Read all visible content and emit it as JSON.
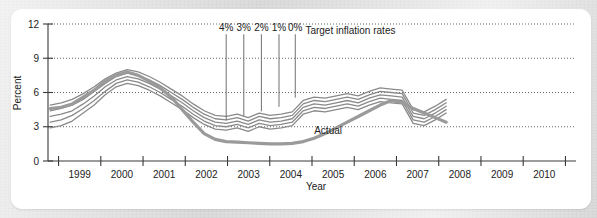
{
  "chart_data": {
    "type": "line",
    "title": "",
    "xlabel": "Year",
    "ylabel": "Percent",
    "xlim": [
      1998.5,
      2010.5
    ],
    "ylim": [
      0,
      12
    ],
    "yticks": [
      0,
      3,
      6,
      9,
      12
    ],
    "xticks": [
      "1999",
      "2000",
      "2001",
      "2002",
      "2003",
      "2004",
      "2005",
      "2006",
      "2007",
      "2008",
      "2009",
      "2010"
    ],
    "grid": "horizontal-dotted",
    "legend_position": "inline-annotations",
    "annotations": [
      {
        "name": "target-legend",
        "text": "Target inflation rates",
        "x": 2004.35,
        "y": 11.1
      },
      {
        "name": "actual-label",
        "text": "Actual",
        "x": 2004.55,
        "y": 2.35
      }
    ],
    "target_markers": [
      {
        "label": "4%",
        "x": 2002.55,
        "y_top": 11.1,
        "y_bottom": 3.55
      },
      {
        "label": "3%",
        "x": 2002.95,
        "y_top": 11.1,
        "y_bottom": 3.95
      },
      {
        "label": "2%",
        "x": 2003.35,
        "y_top": 11.1,
        "y_bottom": 4.35
      },
      {
        "label": "1%",
        "x": 2003.75,
        "y_top": 11.1,
        "y_bottom": 4.75
      },
      {
        "label": "0%",
        "x": 2004.12,
        "y_top": 11.1,
        "y_bottom": 5.55
      }
    ],
    "x": [
      1998.55,
      1998.8,
      1999.05,
      1999.3,
      1999.55,
      1999.8,
      2000.05,
      2000.3,
      2000.55,
      2000.8,
      2001.05,
      2001.3,
      2001.55,
      2001.8,
      2002.05,
      2002.3,
      2002.55,
      2002.8,
      2003.05,
      2003.3,
      2003.55,
      2003.8,
      2004.05,
      2004.3,
      2004.55,
      2004.8,
      2005.05,
      2005.3,
      2005.55,
      2005.8,
      2006.05,
      2006.3,
      2006.55,
      2006.8,
      2007.05,
      2007.3,
      2007.55
    ],
    "series": [
      {
        "name": "Target 4%",
        "color": "#8a8a8a",
        "values": [
          4.9,
          5.1,
          5.4,
          5.9,
          6.5,
          7.2,
          7.7,
          8.0,
          7.8,
          7.4,
          6.9,
          6.3,
          5.7,
          5.0,
          4.4,
          4.0,
          3.9,
          4.1,
          3.8,
          4.2,
          4.0,
          4.1,
          4.3,
          5.3,
          5.6,
          5.5,
          5.7,
          5.9,
          5.7,
          6.1,
          6.4,
          6.3,
          6.2,
          4.5,
          4.3,
          4.8,
          5.4
        ]
      },
      {
        "name": "Target 3%",
        "color": "#8a8a8a",
        "values": [
          4.4,
          4.6,
          4.9,
          5.4,
          6.1,
          6.8,
          7.4,
          7.7,
          7.5,
          7.1,
          6.6,
          6.0,
          5.4,
          4.7,
          4.1,
          3.7,
          3.6,
          3.8,
          3.5,
          3.9,
          3.7,
          3.8,
          4.0,
          5.0,
          5.3,
          5.2,
          5.4,
          5.6,
          5.4,
          5.8,
          6.1,
          6.0,
          5.9,
          4.2,
          4.0,
          4.5,
          5.1
        ]
      },
      {
        "name": "Target 2%",
        "color": "#8a8a8a",
        "values": [
          3.9,
          4.1,
          4.4,
          5.0,
          5.7,
          6.5,
          7.1,
          7.4,
          7.2,
          6.8,
          6.3,
          5.7,
          5.1,
          4.4,
          3.8,
          3.4,
          3.3,
          3.5,
          3.2,
          3.6,
          3.4,
          3.5,
          3.7,
          4.7,
          5.0,
          4.9,
          5.1,
          5.3,
          5.1,
          5.5,
          5.8,
          5.7,
          5.6,
          3.9,
          3.7,
          4.2,
          4.8
        ]
      },
      {
        "name": "Target 1%",
        "color": "#8a8a8a",
        "values": [
          3.4,
          3.6,
          4.0,
          4.6,
          5.3,
          6.1,
          6.8,
          7.1,
          6.9,
          6.5,
          6.0,
          5.4,
          4.8,
          4.1,
          3.5,
          3.1,
          3.0,
          3.2,
          2.9,
          3.3,
          3.1,
          3.2,
          3.4,
          4.4,
          4.7,
          4.6,
          4.8,
          5.0,
          4.8,
          5.2,
          5.5,
          5.4,
          5.3,
          3.6,
          3.4,
          3.9,
          4.5
        ]
      },
      {
        "name": "Target 0%",
        "color": "#8a8a8a",
        "values": [
          2.9,
          3.1,
          3.5,
          4.2,
          4.9,
          5.8,
          6.5,
          6.8,
          6.6,
          6.2,
          5.7,
          5.1,
          4.5,
          3.8,
          3.2,
          2.8,
          2.7,
          2.9,
          2.6,
          3.0,
          2.8,
          2.9,
          3.1,
          4.1,
          4.4,
          4.3,
          4.5,
          4.7,
          4.5,
          4.9,
          5.2,
          5.1,
          5.0,
          3.3,
          3.1,
          3.6,
          4.2
        ]
      },
      {
        "name": "Actual",
        "color": "#9a9a9a",
        "width": 3.2,
        "values": [
          4.6,
          4.7,
          5.0,
          5.6,
          6.2,
          7.0,
          7.5,
          7.8,
          7.5,
          7.0,
          6.4,
          5.6,
          4.5,
          3.4,
          2.4,
          1.9,
          1.7,
          1.65,
          1.6,
          1.55,
          1.5,
          1.5,
          1.55,
          1.7,
          2.0,
          2.4,
          2.9,
          3.4,
          3.9,
          4.4,
          4.9,
          5.3,
          5.1,
          4.6,
          4.2,
          3.8,
          3.4
        ]
      }
    ]
  }
}
